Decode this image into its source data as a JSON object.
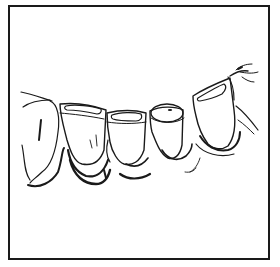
{
  "figure": {
    "tooth_count": 5,
    "frame": true,
    "colors": {
      "ink": "#1a1a1a",
      "background": "#ffffff"
    }
  }
}
